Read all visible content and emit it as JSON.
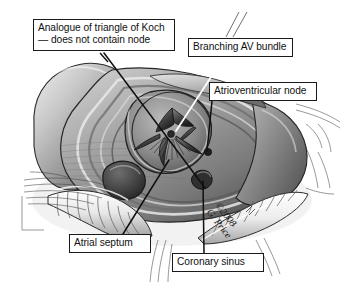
{
  "figure": {
    "modality": "grayscale anatomical illustration",
    "width": 344,
    "height": 285,
    "background_color": "#ffffff",
    "line_color": "#1a1a1a",
    "box_fill": "#ffffff",
    "text_color": "#111111"
  },
  "callouts": [
    {
      "id": "koch",
      "name": "analogue-of-triangle-of-koch",
      "line1": "Analogue of triangle of Koch",
      "line2": "— does not contain node",
      "text": "Analogue of triangle of Koch\n— does not contain node",
      "leader_color": "#101010",
      "leader_style": "solid-dark"
    },
    {
      "id": "avbundle",
      "name": "branching-av-bundle",
      "text": "Branching AV bundle",
      "leader_color": "#ffffff",
      "leader_style": "solid-white"
    },
    {
      "id": "avnode",
      "name": "atrioventricular-node",
      "text": "Atrioventricular node",
      "leader_color": "#101010",
      "leader_style": "solid-dark"
    },
    {
      "id": "septum",
      "name": "atrial-septum",
      "text": "Atrial septum",
      "leader_color": "#101010",
      "leader_style": "solid-dark"
    },
    {
      "id": "cs",
      "name": "coronary-sinus",
      "text": "Coronary sinus",
      "leader_color": "#101010",
      "leader_style": "solid-dark"
    }
  ],
  "signature": {
    "line1": "©2008",
    "line2": "G. Price",
    "text": "©2008\nG. Price",
    "rotation_deg": 52
  },
  "palette": {
    "paper": "#ffffff",
    "ink": "#1a1a1a",
    "tissue_light": "#d8d8d8",
    "tissue_mid": "#9a9a9a",
    "tissue_dark": "#565656",
    "tissue_deep": "#2e2e2e",
    "vessel_rib_light": "#f2f2f2",
    "vessel_rib_dark": "#8c8c8c"
  }
}
